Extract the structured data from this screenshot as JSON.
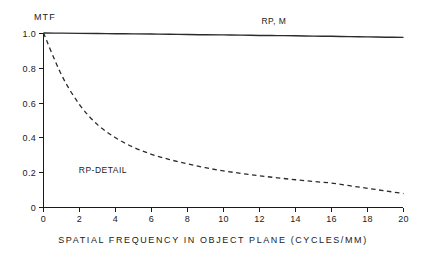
{
  "chart_data": {
    "type": "line",
    "title": "",
    "xlabel": "SPATIAL FREQUENCY IN OBJECT PLANE (CYCLES/MM)",
    "ylabel": "MTF",
    "xlim": [
      0,
      20
    ],
    "ylim": [
      0,
      1.0
    ],
    "xticks": [
      0,
      2,
      4,
      6,
      8,
      10,
      12,
      14,
      16,
      18,
      20
    ],
    "xtick_labels": [
      "0",
      "2",
      "4",
      "6",
      "8",
      "10",
      "12",
      "14",
      "16",
      "18",
      "20"
    ],
    "yticks": [
      0,
      0.2,
      0.4,
      0.6,
      0.8,
      1.0
    ],
    "ytick_labels": [
      "0",
      "0.2",
      "0.4",
      "0.6",
      "0.8",
      "1.0"
    ],
    "grid": false,
    "legend_position": "inline-annotations",
    "x": [
      0,
      1,
      2,
      3,
      4,
      5,
      6,
      7,
      8,
      9,
      10,
      11,
      12,
      13,
      14,
      15,
      16,
      17,
      18,
      19,
      20
    ],
    "series": [
      {
        "name": "RP, M",
        "style": "solid",
        "label": "RP, M",
        "label_x": 12.8,
        "label_y": 1.05,
        "values": [
          1.0,
          0.999,
          0.998,
          0.997,
          0.996,
          0.995,
          0.994,
          0.993,
          0.991,
          0.99,
          0.989,
          0.988,
          0.986,
          0.985,
          0.984,
          0.982,
          0.981,
          0.979,
          0.978,
          0.976,
          0.975
        ]
      },
      {
        "name": "RP-DETAIL",
        "style": "dashed",
        "label": "RP-DETAIL",
        "label_x": 3.3,
        "label_y": 0.2,
        "values": [
          1.0,
          0.76,
          0.59,
          0.475,
          0.4,
          0.345,
          0.305,
          0.275,
          0.25,
          0.228,
          0.21,
          0.195,
          0.182,
          0.17,
          0.159,
          0.149,
          0.14,
          0.125,
          0.11,
          0.095,
          0.08
        ]
      }
    ]
  },
  "axis_labels": {
    "y_axis_title": "MTF",
    "x_axis_title": "SPATIAL FREQUENCY IN OBJECT PLANE (CYCLES/MM)"
  }
}
